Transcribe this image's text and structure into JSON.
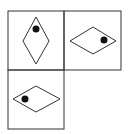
{
  "puzzle": {
    "colors": {
      "line": "#333333",
      "dot": "#111111",
      "background": "#ffffff"
    },
    "cells": [
      {
        "position": "top-left",
        "shape": "rhombus",
        "orientation": "vertical",
        "dot": "top"
      },
      {
        "position": "top-right",
        "shape": "rhombus",
        "orientation": "horizontal",
        "dot": "right"
      },
      {
        "position": "bottom-left",
        "shape": "rhombus",
        "orientation": "horizontal",
        "dot": "left"
      },
      {
        "position": "bottom-right",
        "shape": "empty",
        "orientation": "",
        "dot": ""
      }
    ]
  }
}
